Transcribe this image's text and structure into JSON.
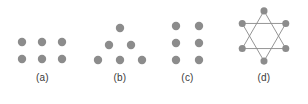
{
  "figure": {
    "background_color": "#ffffff",
    "dot_color": "#8c8c8c",
    "line_color": "#8c8c8c",
    "label_color": "#3a3a3a",
    "dot_radius": 4.2,
    "line_width": 1.1
  },
  "panels": [
    {
      "id": "a",
      "label": "(a)",
      "arrangement": "rectangular-grid-3x2",
      "dot_count": 6,
      "dots": [
        {
          "cx": 22,
          "cy": 42
        },
        {
          "cx": 42,
          "cy": 42
        },
        {
          "cx": 62,
          "cy": 42
        },
        {
          "cx": 22,
          "cy": 59
        },
        {
          "cx": 42,
          "cy": 59
        },
        {
          "cx": 62,
          "cy": 59
        }
      ],
      "lines": []
    },
    {
      "id": "b",
      "label": "(b)",
      "arrangement": "triangle-1-2-3",
      "dot_count": 6,
      "dots": [
        {
          "cx": 35,
          "cy": 28
        },
        {
          "cx": 24,
          "cy": 45
        },
        {
          "cx": 46,
          "cy": 45
        },
        {
          "cx": 13,
          "cy": 60
        },
        {
          "cx": 35,
          "cy": 60
        },
        {
          "cx": 57,
          "cy": 60
        }
      ],
      "lines": []
    },
    {
      "id": "c",
      "label": "(c)",
      "arrangement": "rectangular-grid-2x3",
      "dot_count": 6,
      "dots": [
        {
          "cx": 21,
          "cy": 26
        },
        {
          "cx": 44,
          "cy": 26
        },
        {
          "cx": 21,
          "cy": 43
        },
        {
          "cx": 44,
          "cy": 43
        },
        {
          "cx": 21,
          "cy": 60
        },
        {
          "cx": 44,
          "cy": 60
        }
      ],
      "lines": []
    },
    {
      "id": "d",
      "label": "(d)",
      "arrangement": "hexagram-star-of-david",
      "dot_count": 6,
      "dots": [
        {
          "cx": 44,
          "cy": 13
        },
        {
          "cx": 70,
          "cy": 28
        },
        {
          "cx": 70,
          "cy": 58
        },
        {
          "cx": 44,
          "cy": 73
        },
        {
          "cx": 18,
          "cy": 58
        },
        {
          "cx": 18,
          "cy": 28
        }
      ],
      "lines": [
        {
          "points": "44,13 70,58 18,58",
          "name": "upward-triangle"
        },
        {
          "points": "44,73 18,28 70,28",
          "name": "downward-triangle"
        }
      ]
    }
  ]
}
